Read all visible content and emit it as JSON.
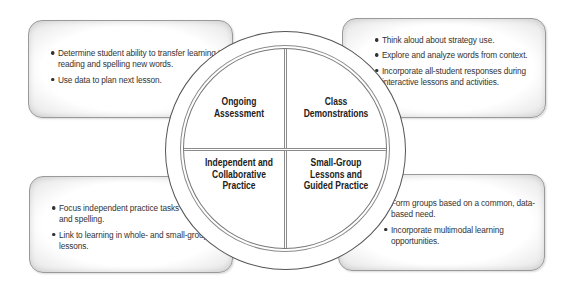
{
  "diagram": {
    "type": "four-quadrant instructional cycle",
    "quadrants": [
      {
        "position": "top-left",
        "label_lines": [
          "Ongoing",
          "Assessment"
        ]
      },
      {
        "position": "top-right",
        "label_lines": [
          "Class",
          "Demonstrations"
        ]
      },
      {
        "position": "bottom-left",
        "label_lines": [
          "Independent and",
          "Collaborative",
          "Practice"
        ]
      },
      {
        "position": "bottom-right",
        "label_lines": [
          "Small-Group",
          "Lessons and",
          "Guided Practice"
        ]
      }
    ],
    "callouts": {
      "top_left": {
        "bullets": [
          "Determine student ability to transfer learning to reading and spelling new words.",
          "Use data to plan next lesson."
        ]
      },
      "top_right": {
        "bullets": [
          "Think aloud about strategy use.",
          "Explore and analyze words from context.",
          "Incorporate all-student responses during interactive lessons and activities."
        ]
      },
      "bottom_left": {
        "bullets": [
          "Focus independent practice tasks on reading and spelling.",
          "Link to learning in whole- and small-group lessons."
        ]
      },
      "bottom_right": {
        "bullets": [
          "Form groups based on a common, data-based need.",
          "Incorporate multimodal learning opportunities."
        ]
      }
    },
    "colors": {
      "text": "#2a2a2a",
      "border": "#9a9a9a",
      "ring_shadow": "#8a8a8a",
      "background": "#ffffff"
    }
  }
}
